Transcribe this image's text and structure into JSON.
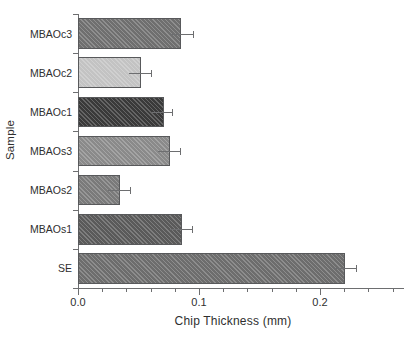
{
  "chart_data": {
    "type": "bar",
    "orientation": "horizontal",
    "title": "",
    "xlabel": "Chip Thickness (mm)",
    "ylabel": "Sample",
    "categories": [
      "SE",
      "MBAOs1",
      "MBAOs2",
      "MBAOs3",
      "MBAOc1",
      "MBAOc2",
      "MBAOc3"
    ],
    "values": [
      0.221,
      0.086,
      0.035,
      0.076,
      0.071,
      0.052,
      0.085
    ],
    "errors": [
      0.009,
      0.008,
      0.008,
      0.008,
      0.007,
      0.008,
      0.01
    ],
    "xlim": [
      0.0,
      0.2695
    ],
    "xticks": [
      0.0,
      0.1,
      0.2
    ],
    "xticklabels": [
      "0.0",
      "0.1",
      "0.2"
    ],
    "xminorticks": [
      0.02,
      0.04,
      0.06,
      0.08,
      0.12,
      0.14,
      0.16,
      0.18,
      0.22,
      0.24,
      0.26
    ],
    "grid": false,
    "legend": false,
    "bar_colors": [
      "#6d6d6d",
      "#5a5a5a",
      "#7a7a7a",
      "#8a8a8a",
      "#3a3a3a",
      "#c3c3c3",
      "#6f6f6f"
    ],
    "edge_color": "#58595b",
    "error_color": "#6d6e70",
    "hatch": "diagonal"
  },
  "axis": {
    "x_title": "Chip Thickness (mm)",
    "y_title": "Sample",
    "x_tick_0": "0.0",
    "x_tick_1": "0.1",
    "x_tick_2": "0.2"
  },
  "bars": [
    {
      "label": "MBAOc3",
      "value": 0.085,
      "error": 0.01,
      "color": "#6f6f6f"
    },
    {
      "label": "MBAOc2",
      "value": 0.052,
      "error": 0.008,
      "color": "#c3c3c3"
    },
    {
      "label": "MBAOc1",
      "value": 0.071,
      "error": 0.007,
      "color": "#3a3a3a"
    },
    {
      "label": "MBAOs3",
      "value": 0.076,
      "error": 0.008,
      "color": "#8a8a8a"
    },
    {
      "label": "MBAOs2",
      "value": 0.035,
      "error": 0.008,
      "color": "#7a7a7a"
    },
    {
      "label": "MBAOs1",
      "value": 0.086,
      "error": 0.008,
      "color": "#5a5a5a"
    },
    {
      "label": "SE",
      "value": 0.221,
      "error": 0.009,
      "color": "#6d6d6d"
    }
  ]
}
